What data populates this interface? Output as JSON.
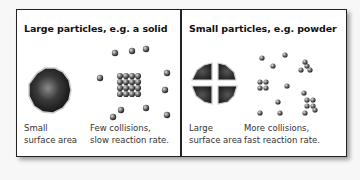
{
  "panels": [
    {
      "title": "Large particles, e.g. a solid",
      "caption_left": [
        "Small",
        "surface area"
      ],
      "caption_right": [
        "Few collisions,",
        "slow reaction rate."
      ]
    },
    {
      "title": "Small particles, e.g. powder",
      "caption_left": [
        "Large",
        "surface area"
      ],
      "caption_right": [
        "More collisions,",
        "fast reaction rate."
      ]
    }
  ],
  "colors": {
    "particle_dark": "#2a2a2a",
    "frame": "#222222"
  }
}
